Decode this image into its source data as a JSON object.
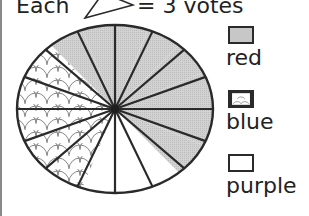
{
  "header": {
    "prefix": "Each",
    "icon": "pie-wedge-icon",
    "suffix": "= 3 votes"
  },
  "legend": {
    "items": [
      {
        "label": "red",
        "fill": "gray-dotted",
        "color": "#cfcfcf"
      },
      {
        "label": "blue",
        "fill": "scallop-pattern",
        "color": "#ffffff"
      },
      {
        "label": "purple",
        "fill": "white",
        "color": "#ffffff"
      }
    ]
  },
  "chart_data": {
    "type": "pie",
    "unit_per_slice": 3,
    "total_slices": 16,
    "categories": [
      "red",
      "blue",
      "purple"
    ],
    "slices": [
      8,
      5,
      3
    ],
    "values": [
      24,
      15,
      9
    ],
    "legend_position": "right",
    "slice_order_clockwise_from_top": [
      "red",
      "red",
      "red",
      "red",
      "red",
      "red",
      "red",
      "purple",
      "purple",
      "purple",
      "blue",
      "blue",
      "blue",
      "blue",
      "blue",
      "red"
    ]
  }
}
